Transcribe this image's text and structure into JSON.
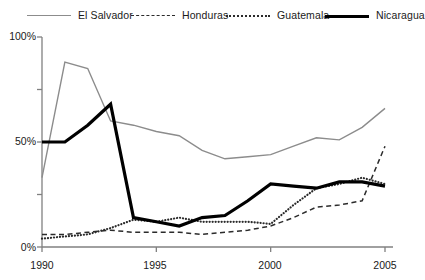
{
  "legend": {
    "position": "top",
    "items": [
      {
        "label": "El Salvador",
        "style": "solid-thin",
        "color": "#8c8c8c",
        "icon": "line-solid-thin-icon"
      },
      {
        "label": "Honduras",
        "style": "dashed",
        "color": "#2b2b2b",
        "icon": "line-dashed-icon"
      },
      {
        "label": "Guatemala",
        "style": "dotted",
        "color": "#2b2b2b",
        "icon": "line-dotted-icon"
      },
      {
        "label": "Nicaragua",
        "style": "solid-thick",
        "color": "#000000",
        "icon": "line-solid-thick-icon"
      }
    ]
  },
  "axes": {
    "y_ticks": [
      "0%",
      "50%",
      "100%"
    ],
    "y_minor_ticks": [
      "25%",
      "75%"
    ],
    "x_ticks": [
      "1990",
      "1995",
      "2000",
      "2005"
    ],
    "axis_color": "#808080"
  },
  "chart_data": {
    "type": "line",
    "title": "",
    "xlabel": "",
    "ylabel": "",
    "xlim": [
      1990,
      2005
    ],
    "ylim": [
      0,
      100
    ],
    "grid": false,
    "legend_position": "top",
    "ytick_values": [
      0,
      25,
      50,
      75,
      100
    ],
    "ytick_labels": [
      "0%",
      "25%",
      "50%",
      "75%",
      "100%"
    ],
    "ytick_labeled": [
      0,
      50,
      100
    ],
    "xtick_values": [
      1990,
      1995,
      2000,
      2005
    ],
    "xtick_labels": [
      "1990",
      "1995",
      "2000",
      "2005"
    ],
    "x": [
      1990,
      1991,
      1992,
      1993,
      1994,
      1995,
      1996,
      1997,
      1998,
      1999,
      2000,
      2001,
      2002,
      2003,
      2004,
      2005
    ],
    "series": [
      {
        "name": "El Salvador",
        "style": "solid-thin",
        "color": "#8c8c8c",
        "values": [
          33,
          88,
          85,
          60,
          58,
          55,
          53,
          46,
          42,
          43,
          44,
          48,
          52,
          51,
          57,
          66
        ]
      },
      {
        "name": "Honduras",
        "style": "dashed",
        "color": "#2b2b2b",
        "values": [
          6,
          6,
          7,
          8,
          7,
          7,
          7,
          6,
          7,
          8,
          10,
          14,
          19,
          20,
          22,
          48
        ]
      },
      {
        "name": "Guatemala",
        "style": "dotted",
        "color": "#2b2b2b",
        "values": [
          4,
          5,
          6,
          9,
          13,
          12,
          14,
          12,
          12,
          12,
          11,
          20,
          28,
          30,
          33,
          30
        ]
      },
      {
        "name": "Nicaragua",
        "style": "solid-thick",
        "color": "#000000",
        "values": [
          50,
          50,
          58,
          68,
          14,
          12,
          10,
          14,
          15,
          22,
          30,
          29,
          28,
          31,
          31,
          29
        ]
      }
    ]
  }
}
